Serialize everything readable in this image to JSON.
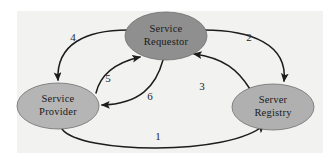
{
  "diagram": {
    "background_color": "#ffffff",
    "panel_color": "#f2f2f1",
    "edge_color": "#1d1d1d",
    "nodes": [
      {
        "id": "service-requestor",
        "label_line1": "Service",
        "label_line2": "Requestor",
        "fill": "#8f8f8f",
        "stroke": "#6e6e6e",
        "cx": 166,
        "cy": 36,
        "rx": 41,
        "ry": 24
      },
      {
        "id": "service-provider",
        "label_line1": "Service",
        "label_line2": "Provider",
        "fill": "#b5b5b5",
        "stroke": "#6e6e6e",
        "cx": 58,
        "cy": 106,
        "rx": 41,
        "ry": 23
      },
      {
        "id": "server-registry",
        "label_line1": "Server",
        "label_line2": "Registry",
        "fill": "#b0b0b0",
        "stroke": "#6e6e6e",
        "cx": 273,
        "cy": 107,
        "rx": 41,
        "ry": 23
      }
    ],
    "edges": [
      {
        "id": "edge-1",
        "label": "1",
        "from": "service-provider",
        "to": "server-registry",
        "label_x": 158,
        "label_y": 140
      },
      {
        "id": "edge-2",
        "label": "2",
        "from": "service-requestor",
        "to": "server-registry",
        "label_x": 249,
        "label_y": 41
      },
      {
        "id": "edge-3",
        "label": "3",
        "from": "server-registry",
        "to": "service-requestor",
        "label_x": 202,
        "label_y": 90
      },
      {
        "id": "edge-4",
        "label": "4",
        "from": "service-requestor",
        "to": "service-provider",
        "label_x": 73,
        "label_y": 41
      },
      {
        "id": "edge-5",
        "label": "5",
        "from": "service-provider",
        "to": "service-requestor",
        "label_x": 108,
        "label_y": 82
      },
      {
        "id": "edge-6",
        "label": "6",
        "from": "service-requestor",
        "to": "service-provider",
        "label_x": 150,
        "label_y": 100
      }
    ]
  }
}
